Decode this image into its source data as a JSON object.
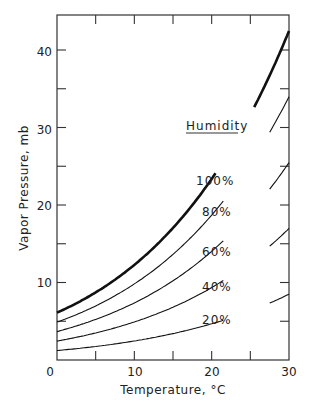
{
  "chart_data": {
    "type": "line",
    "title": "",
    "xlabel": "Temperature, °C",
    "ylabel": "Vapor Pressure, mb",
    "xlim": [
      0,
      30
    ],
    "ylim": [
      0,
      44
    ],
    "x_ticks": [
      0,
      10,
      20,
      30
    ],
    "y_ticks": [
      10,
      20,
      30,
      40
    ],
    "grid": false,
    "legend_title": "Humidity",
    "x": [
      0,
      5,
      10,
      15,
      20,
      25,
      30
    ],
    "series": [
      {
        "name": "100%",
        "values": [
          6.1,
          8.7,
          12.3,
          17.0,
          23.4,
          31.7,
          42.4
        ],
        "bold": true
      },
      {
        "name": "80%",
        "values": [
          4.9,
          7.0,
          9.8,
          13.6,
          18.7,
          25.4,
          33.9
        ]
      },
      {
        "name": "60%",
        "values": [
          3.7,
          5.2,
          7.4,
          10.2,
          14.0,
          19.0,
          25.4
        ]
      },
      {
        "name": "40%",
        "values": [
          2.4,
          3.5,
          4.9,
          6.8,
          9.4,
          12.7,
          17.0
        ]
      },
      {
        "name": "20%",
        "values": [
          1.2,
          1.7,
          2.5,
          3.4,
          4.7,
          6.3,
          8.5
        ]
      }
    ]
  },
  "labels": {
    "x_tick_0": "0",
    "x_tick_10": "10",
    "x_tick_20": "20",
    "x_tick_30": "30",
    "y_tick_10": "10",
    "y_tick_20": "20",
    "y_tick_30": "30",
    "y_tick_40": "40",
    "xlabel": "Temperature, °C",
    "ylabel": "Vapor Pressure, mb",
    "legend_title": "Humidity",
    "s100": "100%",
    "s80": "80%",
    "s60": "60%",
    "s40": "40%",
    "s20": "20%"
  }
}
